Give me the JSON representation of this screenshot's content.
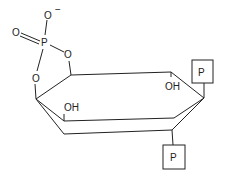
{
  "diagram": {
    "type": "chemical-structure",
    "atoms": {
      "phosphorus": "P",
      "oxygen_minus": "O",
      "minus_sign": "−",
      "oxygen_double": "O",
      "oxygen_ring_right": "O",
      "oxygen_ring_left": "O",
      "hydroxyl_1": "OH",
      "hydroxyl_2": "OH"
    },
    "phosphate_boxes": [
      {
        "label": "P"
      },
      {
        "label": "P"
      }
    ]
  }
}
